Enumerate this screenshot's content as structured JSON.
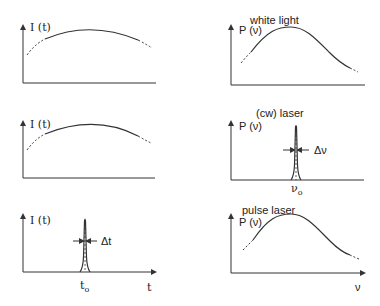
{
  "diagram": {
    "rows": [
      {
        "title": "white light",
        "time_panel": {
          "ylabel": "I (t)",
          "shape": "broad-arc"
        },
        "freq_panel": {
          "ylabel": "P (ν)",
          "shape": "broad-bell"
        }
      },
      {
        "title": "(cw) laser",
        "time_panel": {
          "ylabel": "I (t)",
          "shape": "broad-arc"
        },
        "freq_panel": {
          "ylabel": "P (ν)",
          "shape": "narrow-spike",
          "width_label": "Δν",
          "center_label": "ν",
          "center_sub": "o"
        }
      },
      {
        "title": "pulse laser",
        "time_panel": {
          "ylabel": "I (t)",
          "shape": "narrow-spike",
          "width_label": "Δt",
          "center_label": "t",
          "center_sub": "o",
          "xlabel": "t"
        },
        "freq_panel": {
          "ylabel": "P (ν)",
          "shape": "broad-bell",
          "xlabel": "ν"
        }
      }
    ],
    "stroke_color": "#333333"
  }
}
